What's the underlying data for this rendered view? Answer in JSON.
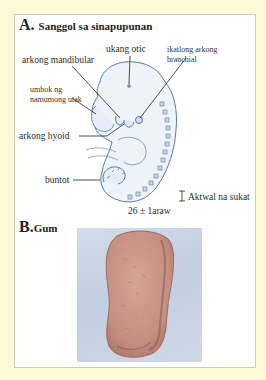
{
  "figure": {
    "background_color": "#fdf9d6",
    "panel_color": "#ffffff",
    "section_a": {
      "letter": "A.",
      "title": "Sanggol sa sinapupunan",
      "labels": {
        "otic_pit": "ukang otic",
        "mandibular_arch": "arkong mandibular",
        "third_branchial_arch_line1": "ikatlong arkong",
        "third_branchial_arch_line2": "branchial",
        "forebrain_line1": "umbok ng",
        "forebrain_line2": "namumong utak",
        "hyoid_arch": "arkong hyoid",
        "tail": "buntot"
      },
      "scale_label": "Aktwal na sukat",
      "age_label": "26 ± 1araw",
      "illustration": "embryo-drawing"
    },
    "section_b": {
      "letter": "B.",
      "title": "Gum",
      "illustration": "chewed-gum-photo"
    }
  }
}
